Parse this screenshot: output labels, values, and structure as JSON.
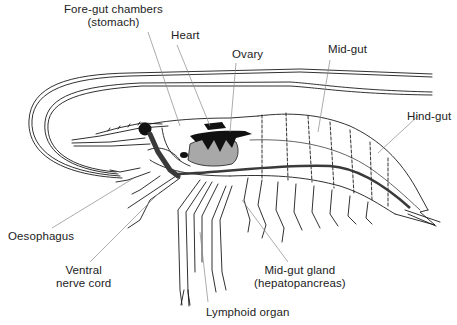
{
  "figure": {
    "colors": {
      "outline": "#1a1a1a",
      "leader_line": "#888888",
      "dark_organ": "#111111",
      "gut_tract": "#3a3a3a",
      "gland_fill": "#a8a8a8",
      "background": "#ffffff"
    },
    "labels": {
      "foregut": {
        "line1": "Fore-gut chambers",
        "line2": "(stomach)"
      },
      "heart": "Heart",
      "ovary": "Ovary",
      "midgut": "Mid-gut",
      "hindgut": "Hind-gut",
      "oesophagus": "Oesophagus",
      "ventral": {
        "line1": "Ventral",
        "line2": "nerve cord"
      },
      "midgut_gland": {
        "line1": "Mid-gut gland",
        "line2": "(hepatopancreas)"
      },
      "lymphoid": "Lymphoid organ"
    }
  }
}
